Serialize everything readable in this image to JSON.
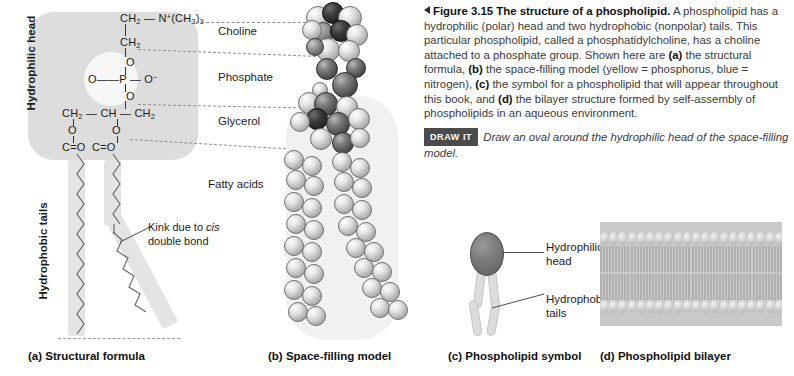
{
  "figure": {
    "arrow_icon": "left-triangle-icon",
    "number": "Figure 3.15",
    "title": "The structure of a phospholipid.",
    "caption_body": " A phospholipid has a hydrophilic (polar) head and two hydrophobic (nonpolar) tails. This particular phospholipid, called a phosphatidylcholine, has a choline attached to a phosphate group. Shown here are ",
    "caption_a_bold": "(a)",
    "caption_seg2": " the structural formula, ",
    "caption_b_bold": "(b)",
    "caption_seg3": " the space-filling model (yellow = phosphorus, blue = nitrogen), ",
    "caption_c_bold": "(c)",
    "caption_seg4": " the symbol for a phospholipid that will appear throughout this book, and ",
    "caption_d_bold": "(d)",
    "caption_seg5": " the bilayer structure formed by self-assembly of phospholipids in an aqueous environment.",
    "draw_it_badge": "DRAW IT",
    "draw_it_text": "Draw an oval around the hydrophilic head of the space-filling model."
  },
  "panel_a": {
    "head_label": "Hydrophilic head",
    "tails_label": "Hydrophobic tails",
    "kink_label_line1": "Kink due to ",
    "kink_label_italic": "cis",
    "kink_label_line2": "double bond",
    "formula": {
      "choline_top": "CH2 — N+(CH3)3",
      "ch2_second": "CH2",
      "o_top": "O",
      "phosphate": "O = P — O−",
      "o_bottom": "O",
      "glycerol": "CH2 — CH — CH2",
      "o_left": "O",
      "o_right": "O",
      "carbonyls": "C = O   C = O"
    },
    "side_labels": {
      "choline": "Choline",
      "phosphate": "Phosphate",
      "glycerol": "Glycerol",
      "fatty_acids": "Fatty acids"
    }
  },
  "panel_c": {
    "head_label_line1": "Hydrophilic",
    "head_label_line2": "head",
    "tails_label_line1": "Hydrophobic",
    "tails_label_line2": "tails"
  },
  "captions": {
    "a": "(a) Structural formula",
    "b": "(b) Space-filling model",
    "c": "(c) Phospholipid symbol",
    "d": "(d) Phospholipid bilayer"
  },
  "colors": {
    "head_box": "#dddddd",
    "band": "#e4e4e4",
    "badge": "#4b4b4b",
    "bilayer": "#c9c9c9"
  }
}
